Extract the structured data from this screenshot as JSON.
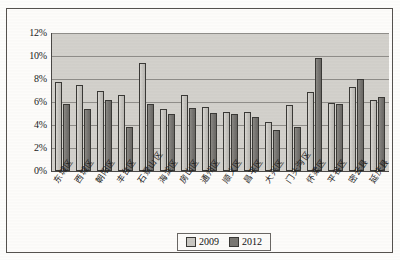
{
  "chart_data": {
    "type": "bar",
    "title": "",
    "xlabel": "",
    "ylabel": "",
    "ylim": [
      0,
      12
    ],
    "grid": true,
    "legend_position": "bottom",
    "y_ticks": [
      "0%",
      "2%",
      "4%",
      "6%",
      "8%",
      "10%",
      "12%"
    ],
    "categories": [
      "东城区",
      "西城区",
      "朝阳区",
      "丰台区",
      "石景山区",
      "海淀区",
      "房山区",
      "通州区",
      "顺义区",
      "昌平区",
      "大兴区",
      "门头沟区",
      "怀柔区",
      "平谷区",
      "密云县",
      "延庆县"
    ],
    "series": [
      {
        "name": "2009",
        "color": "#c9c7c2",
        "values": [
          7.7,
          7.5,
          7.0,
          6.65,
          9.4,
          5.4,
          6.6,
          5.55,
          5.15,
          5.1,
          4.3,
          5.75,
          6.85,
          5.9,
          7.3,
          6.2
        ]
      },
      {
        "name": "2012",
        "color": "#7a7873",
        "values": [
          5.8,
          5.35,
          6.2,
          3.85,
          5.8,
          5.0,
          5.5,
          5.05,
          4.95,
          4.7,
          3.55,
          3.8,
          9.85,
          5.85,
          8.0,
          6.45
        ]
      }
    ]
  },
  "legend": {
    "items": [
      {
        "label": "2009"
      },
      {
        "label": "2012"
      }
    ]
  },
  "colors": {
    "plot_background": "#d3d1cc",
    "gridline": "#8f8d89",
    "axis": "#4a4846",
    "frame": "#55524e",
    "series_2009": "#c9c7c2",
    "series_2012": "#7a7873"
  }
}
